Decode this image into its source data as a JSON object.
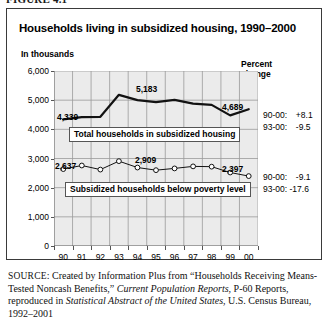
{
  "figure": {
    "label": "FIGURE 4.1"
  },
  "chart_title": "Households living in subsidized housing, 1990–2000",
  "axis_unit_label": "In thousands",
  "percent_header_line1": "Percent",
  "percent_header_line2": "change",
  "series_tags": {
    "total": "Total households in subsidized housing",
    "poverty": "Subsidized households below poverty level"
  },
  "callouts": {
    "total_start": "4,339",
    "total_peak": "5,183",
    "total_end": "4,689",
    "poverty_start": "2,637",
    "poverty_peak": "2,909",
    "poverty_end": "2,397"
  },
  "percent_change": {
    "total": [
      {
        "period": "90-00:",
        "value": "+8.1"
      },
      {
        "period": "93-00:",
        "value": "-9.5"
      }
    ],
    "poverty": [
      {
        "period": "90-00:",
        "value": "-9.1"
      },
      {
        "period": "93-00:",
        "value": "-17.6"
      }
    ]
  },
  "source": {
    "prefix": "SOURCE",
    "text_1": ": Created by Information Plus from “Households Receiving Means-Tested Noncash Benefits,” ",
    "italic_1": "Current Population Reports",
    "text_2": ", P-60 Reports, reproduced in ",
    "italic_2": "Statistical Abstract of the United States",
    "text_3": ", U.S. Census Bureau, 1992–2001"
  },
  "chart_data": {
    "type": "line",
    "title": "Households living in subsidized housing, 1990–2000",
    "xlabel": "",
    "ylabel": "In thousands",
    "ylim": [
      0,
      6000
    ],
    "yticks": [
      0,
      1000,
      2000,
      3000,
      4000,
      5000,
      6000
    ],
    "ytick_labels": [
      "0",
      "1,000",
      "2,000",
      "3,000",
      "4,000",
      "5,000",
      "6,000"
    ],
    "grid": true,
    "legend_position": "inline-boxed-labels",
    "categories": [
      "90",
      "91",
      "92",
      "93",
      "94",
      "95",
      "96",
      "97",
      "98",
      "99",
      "00"
    ],
    "series": [
      {
        "name": "Total households in subsidized housing",
        "style": "thick-line-no-markers",
        "values": [
          4339,
          4420,
          4430,
          5183,
          5000,
          4930,
          5010,
          4880,
          4840,
          4480,
          4689
        ]
      },
      {
        "name": "Subsidized households below poverty level",
        "style": "thin-line-open-circle-markers",
        "values": [
          2637,
          2760,
          2620,
          2909,
          2690,
          2600,
          2660,
          2730,
          2720,
          2520,
          2397
        ]
      }
    ],
    "annotations": [
      {
        "series": "Total households in subsidized housing",
        "category": "90",
        "label": "4,339"
      },
      {
        "series": "Total households in subsidized housing",
        "category": "93",
        "label": "5,183"
      },
      {
        "series": "Total households in subsidized housing",
        "category": "00",
        "label": "4,689"
      },
      {
        "series": "Subsidized households below poverty level",
        "category": "90",
        "label": "2,637"
      },
      {
        "series": "Subsidized households below poverty level",
        "category": "93",
        "label": "2,909"
      },
      {
        "series": "Subsidized households below poverty level",
        "category": "00",
        "label": "2,397"
      }
    ]
  },
  "colors": {
    "plot_background": "#ebebeb",
    "gridline": "#9a9a9a",
    "axis": "#555555",
    "series_line": "#121212",
    "frame": "#3a3a3a"
  }
}
